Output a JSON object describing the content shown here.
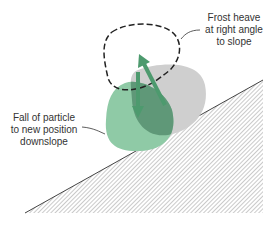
{
  "diagram": {
    "labels": {
      "frost_heave": [
        "Frost heave",
        "at right angle",
        "to slope"
      ],
      "fall": [
        "Fall of particle",
        "to new position",
        "downslope"
      ]
    },
    "colors": {
      "green_particle": "#8cc9a4",
      "gray_particle": "#c9c9c9",
      "overlap": "#5e9a78",
      "arrow": "#4d9a6e",
      "hatch": "#555555"
    }
  }
}
